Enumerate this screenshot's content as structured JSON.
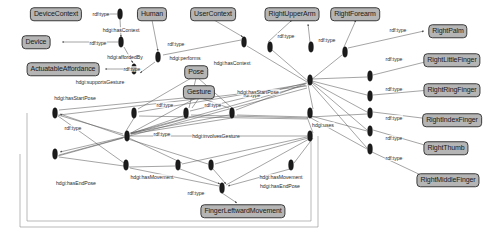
{
  "diagram": {
    "type": "rdf-graph",
    "prefix_namespace": "hdgi",
    "colors": {
      "node_fill": "#b5b5b5",
      "node_border": "#3a3a3a",
      "edge": "#5a5a5a",
      "blank_node": "#1c1c1c",
      "background": "#ffffff"
    }
  },
  "class_nodes": [
    {
      "id": "deviceContext",
      "label": "DeviceContext",
      "x": 56,
      "y": 14
    },
    {
      "id": "device",
      "label": "Device",
      "x": 36,
      "y": 42
    },
    {
      "id": "actuatableAffordance",
      "label": "ActuatableAffordance",
      "x": 63,
      "y": 69
    },
    {
      "id": "human",
      "label": "Human",
      "x": 152,
      "y": 14
    },
    {
      "id": "userContext",
      "label": "UserContext",
      "x": 213,
      "y": 14
    },
    {
      "id": "pose",
      "label": "Pose",
      "x": 196,
      "y": 72
    },
    {
      "id": "gesture",
      "label": "Gesture",
      "x": 199,
      "y": 92
    },
    {
      "id": "rightUpperArm",
      "label": "RightUpperArm",
      "x": 292,
      "y": 14
    },
    {
      "id": "rightForearm",
      "label": "RightForearm",
      "x": 355,
      "y": 14
    },
    {
      "id": "rightPalm",
      "label": "RightPalm",
      "x": 448,
      "y": 31
    },
    {
      "id": "rightLittleFinger",
      "label": "RightLittleFinger",
      "x": 452,
      "y": 60
    },
    {
      "id": "rightRingFinger",
      "label": "RightRingFinger",
      "x": 452,
      "y": 90
    },
    {
      "id": "rightIndexFinger",
      "label": "RightIndexFinger",
      "x": 452,
      "y": 120
    },
    {
      "id": "rightThumb",
      "label": "RightThumb",
      "x": 446,
      "y": 148
    },
    {
      "id": "rightMiddleFinger",
      "label": "RightMiddleFinger",
      "x": 448,
      "y": 180
    },
    {
      "id": "fingerLeftwardMovement",
      "label": "FingerLeftwardMovement",
      "x": 243,
      "y": 211
    }
  ],
  "edge_labels": [
    {
      "id": "l1",
      "label": "rdf:type",
      "x": 101,
      "y": 14
    },
    {
      "id": "l2",
      "label": "hdgi:hasContext",
      "x": 121,
      "y": 30
    },
    {
      "id": "l3",
      "label": "rdf:type",
      "x": 98,
      "y": 43
    },
    {
      "id": "l4",
      "label": "hdgi:affordedBy",
      "x": 125,
      "y": 57
    },
    {
      "id": "l5",
      "label": "rdf:type",
      "x": 132,
      "y": 69
    },
    {
      "id": "l6",
      "label": "hdgi:supportsGesture",
      "x": 100,
      "y": 82
    },
    {
      "id": "l7",
      "label": "rdf:type",
      "x": 176,
      "y": 44
    },
    {
      "id": "l8",
      "label": "hdgi:performs",
      "x": 185,
      "y": 58
    },
    {
      "id": "l9",
      "label": "hdgi:hasContext",
      "x": 232,
      "y": 63
    },
    {
      "id": "l10",
      "label": "rdf:type",
      "x": 252,
      "y": 95
    },
    {
      "id": "l11",
      "label": "rdf:type",
      "x": 286,
      "y": 36
    },
    {
      "id": "l12",
      "label": "rdf:type",
      "x": 327,
      "y": 40
    },
    {
      "id": "l13",
      "label": "rdf:type",
      "x": 398,
      "y": 30
    },
    {
      "id": "l14",
      "label": "rdf:type",
      "x": 394,
      "y": 59
    },
    {
      "id": "l15",
      "label": "rdf:type",
      "x": 394,
      "y": 89
    },
    {
      "id": "l16",
      "label": "rdf:type",
      "x": 394,
      "y": 118
    },
    {
      "id": "l17",
      "label": "rdf:type",
      "x": 394,
      "y": 138
    },
    {
      "id": "l18",
      "label": "rdf:type",
      "x": 394,
      "y": 158
    },
    {
      "id": "l19",
      "label": "hdgi:uses",
      "x": 323,
      "y": 125
    },
    {
      "id": "l20",
      "label": "hdgi:hasStartPose",
      "x": 75,
      "y": 98
    },
    {
      "id": "l21",
      "label": "hdgi:hasStartPose",
      "x": 258,
      "y": 92
    },
    {
      "id": "l22",
      "label": "rdf:type",
      "x": 73,
      "y": 128
    },
    {
      "id": "l23",
      "label": "rdf:type",
      "x": 165,
      "y": 105
    },
    {
      "id": "l24",
      "label": "rdf:type",
      "x": 213,
      "y": 105
    },
    {
      "id": "l25",
      "label": "hdgi:involvesGesture",
      "x": 216,
      "y": 136
    },
    {
      "id": "l26",
      "label": "rdf:type",
      "x": 162,
      "y": 134
    },
    {
      "id": "l27",
      "label": "hdgi:hasEndPose",
      "x": 76,
      "y": 183
    },
    {
      "id": "l28",
      "label": "hdgi:hasMovement",
      "x": 152,
      "y": 177
    },
    {
      "id": "l29",
      "label": "rdf:type",
      "x": 196,
      "y": 193
    },
    {
      "id": "l30",
      "label": "hdgi:hasMovement",
      "x": 281,
      "y": 177
    },
    {
      "id": "l31",
      "label": "hdgi:hasEndPose",
      "x": 280,
      "y": 186
    }
  ],
  "blank_nodes": [
    {
      "id": "b1",
      "x": 120,
      "y": 14
    },
    {
      "id": "b2",
      "x": 121,
      "y": 42
    },
    {
      "id": "b3",
      "x": 134,
      "y": 69
    },
    {
      "id": "b4",
      "x": 158,
      "y": 57
    },
    {
      "id": "b5",
      "x": 244,
      "y": 42
    },
    {
      "id": "b6",
      "x": 270,
      "y": 47
    },
    {
      "id": "b7",
      "x": 311,
      "y": 47
    },
    {
      "id": "b8",
      "x": 345,
      "y": 52
    },
    {
      "id": "b9",
      "x": 310,
      "y": 80
    },
    {
      "id": "b10",
      "x": 370,
      "y": 76
    },
    {
      "id": "b11",
      "x": 370,
      "y": 96
    },
    {
      "id": "b12",
      "x": 370,
      "y": 113
    },
    {
      "id": "b13",
      "x": 370,
      "y": 131
    },
    {
      "id": "b14",
      "x": 370,
      "y": 149
    },
    {
      "id": "b15",
      "x": 55,
      "y": 113
    },
    {
      "id": "b16",
      "x": 55,
      "y": 154
    },
    {
      "id": "b17",
      "x": 134,
      "y": 113
    },
    {
      "id": "b18",
      "x": 186,
      "y": 113
    },
    {
      "id": "b19",
      "x": 232,
      "y": 113
    },
    {
      "id": "b20",
      "x": 127,
      "y": 136
    },
    {
      "id": "b21",
      "x": 310,
      "y": 136
    },
    {
      "id": "b22",
      "x": 126,
      "y": 165
    },
    {
      "id": "b23",
      "x": 178,
      "y": 165
    },
    {
      "id": "b24",
      "x": 211,
      "y": 165
    },
    {
      "id": "b25",
      "x": 222,
      "y": 188
    },
    {
      "id": "b26",
      "x": 291,
      "y": 165
    },
    {
      "id": "b27",
      "x": 310,
      "y": 113
    }
  ]
}
